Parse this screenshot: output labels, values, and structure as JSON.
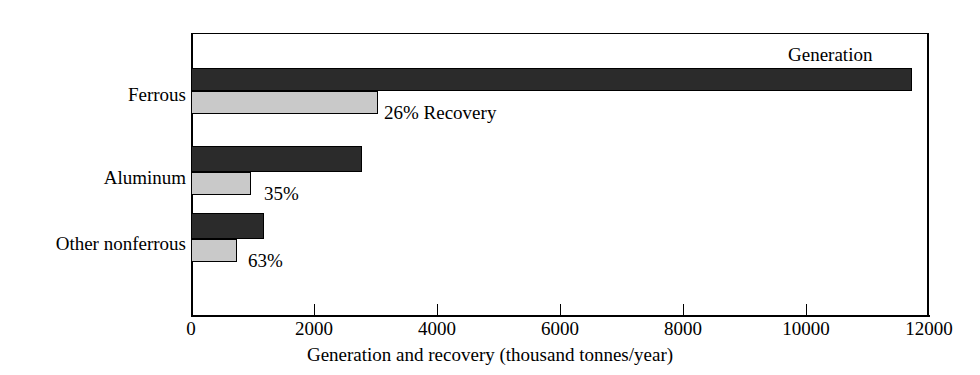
{
  "chart_data": {
    "type": "bar",
    "orientation": "horizontal",
    "title": "",
    "xlabel": "Generation and recovery (thousand tonnes/year)",
    "ylabel": "",
    "xlim": [
      0,
      12000
    ],
    "ylim": null,
    "grid": false,
    "legend_position": "inline-annotation",
    "xticks": [
      0,
      2000,
      4000,
      6000,
      8000,
      10000,
      12000
    ],
    "xtick_labels": [
      "0",
      "2000",
      "4000",
      "6000",
      "8000",
      "10000",
      "12000"
    ],
    "categories": [
      "Ferrous",
      "Aluminum",
      "Other nonferrous"
    ],
    "series": [
      {
        "name": "Generation",
        "color": "#2b2b2b",
        "values": [
          11700,
          2770,
          1190
        ]
      },
      {
        "name": "Recovery",
        "color": "#c9c9c9",
        "values": [
          3040,
          970,
          750
        ]
      }
    ],
    "recovery_percent_labels": [
      "26% Recovery",
      "35%",
      "63%"
    ],
    "recovery_percents": [
      26,
      35,
      63
    ],
    "generation_label": "Generation"
  },
  "axis": {
    "x_title": "Generation and recovery (thousand tonnes/year)",
    "ticks": [
      {
        "value": "0",
        "x": 191
      },
      {
        "value": "2000",
        "x": 314
      },
      {
        "value": "4000",
        "x": 437
      },
      {
        "value": "6000",
        "x": 560
      },
      {
        "value": "8000",
        "x": 683
      },
      {
        "value": "10000",
        "x": 806
      },
      {
        "value": "12000",
        "x": 929
      }
    ]
  },
  "categories": [
    {
      "label": "Ferrous",
      "label_top": 85,
      "gen_top": 68,
      "gen_h": 23,
      "gen_w": 721,
      "rec_top": 91,
      "rec_h": 23,
      "rec_w": 187,
      "annot": "26% Recovery",
      "annot_x": 384,
      "annot_top": 103
    },
    {
      "label": "Aluminum",
      "label_top": 168,
      "gen_top": 146,
      "gen_h": 26,
      "gen_w": 171,
      "rec_top": 172,
      "rec_h": 23,
      "rec_w": 60,
      "annot": "35%",
      "annot_x": 264,
      "annot_top": 184
    },
    {
      "label": "Other nonferrous",
      "label_top": 234,
      "gen_top": 213,
      "gen_h": 26,
      "gen_w": 73,
      "rec_top": 239,
      "rec_h": 23,
      "rec_w": 46,
      "annot": "63%",
      "annot_x": 248,
      "annot_top": 251
    }
  ],
  "generation_annotation": {
    "text": "Generation",
    "left": 788,
    "top": 45
  },
  "colors": {
    "generation": "#2b2b2b",
    "recovery": "#c9c9c9",
    "axis": "#000000",
    "background": "#ffffff"
  }
}
